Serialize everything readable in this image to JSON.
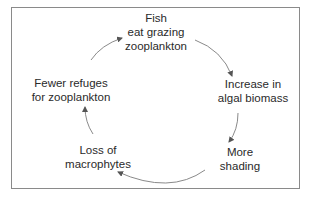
{
  "diagram": {
    "type": "cycle",
    "nodes": [
      {
        "id": "fish",
        "lines": [
          "Fish",
          "eat grazing",
          "zooplankton"
        ]
      },
      {
        "id": "algal",
        "lines": [
          "Increase in",
          "algal biomass"
        ]
      },
      {
        "id": "shading",
        "lines": [
          "More",
          "shading"
        ]
      },
      {
        "id": "macrophytes",
        "lines": [
          "Loss of",
          "macrophytes"
        ]
      },
      {
        "id": "refuges",
        "lines": [
          "Fewer refuges",
          "for zooplankton"
        ]
      }
    ],
    "edges": [
      {
        "from": "fish",
        "to": "algal"
      },
      {
        "from": "algal",
        "to": "shading"
      },
      {
        "from": "shading",
        "to": "macrophytes"
      },
      {
        "from": "macrophytes",
        "to": "refuges"
      },
      {
        "from": "refuges",
        "to": "fish"
      }
    ],
    "colors": {
      "frame": "#8a8a8a",
      "arrow": "#7a7a7a",
      "text": "#2a2a2a"
    }
  }
}
